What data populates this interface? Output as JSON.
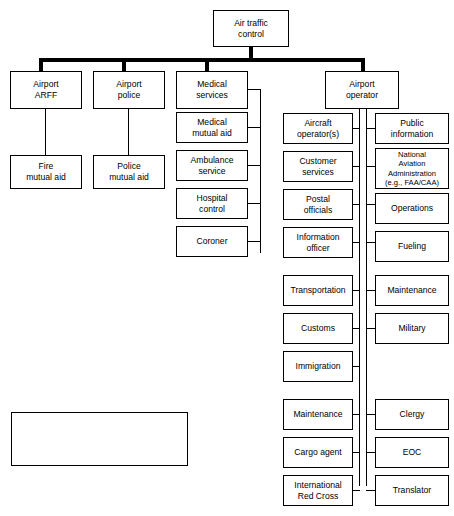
{
  "diagram": {
    "root": {
      "label": "Air traffic\ncontrol"
    },
    "level1": [
      {
        "label": "Airport\nARFF"
      },
      {
        "label": "Airport\npolice"
      },
      {
        "label": "Medical\nservices"
      },
      {
        "label": "Airport\noperator"
      }
    ],
    "arff_children": [
      {
        "label": "Fire\nmutual aid"
      }
    ],
    "police_children": [
      {
        "label": "Police\nmutual aid"
      }
    ],
    "medical_children": [
      {
        "label": "Medical\nmutual aid"
      },
      {
        "label": "Ambulance\nservice"
      },
      {
        "label": "Hospital\ncontrol"
      },
      {
        "label": "Coroner"
      }
    ],
    "operator_left_column": [
      {
        "label": "Aircraft\noperator(s)"
      },
      {
        "label": "Customer\nservices"
      },
      {
        "label": "Postal\nofficials"
      },
      {
        "label": "Information\nofficer"
      },
      {
        "label": "Transportation"
      },
      {
        "label": "Customs"
      },
      {
        "label": "Immigration"
      },
      {
        "label": "Maintenance"
      },
      {
        "label": "Cargo agent"
      },
      {
        "label": "International\nRed Cross"
      }
    ],
    "operator_right_column": [
      {
        "label": "Public\ninformation"
      },
      {
        "label": "National\nAviation\nAdministration\n(e.g., FAA/CAA)"
      },
      {
        "label": "Operations"
      },
      {
        "label": "Fueling"
      },
      {
        "label": "Maintenance"
      },
      {
        "label": "Military"
      },
      {
        "label": "Clergy"
      },
      {
        "label": "EOC"
      },
      {
        "label": "Translator"
      }
    ]
  },
  "legend": {
    "title": "Legend",
    "alarm_label": "Alarm notification",
    "telephone_label": "Telephone notification"
  },
  "colors": {
    "line": "#000000",
    "box_fill": "#ffffff",
    "background": "#ffffff"
  }
}
